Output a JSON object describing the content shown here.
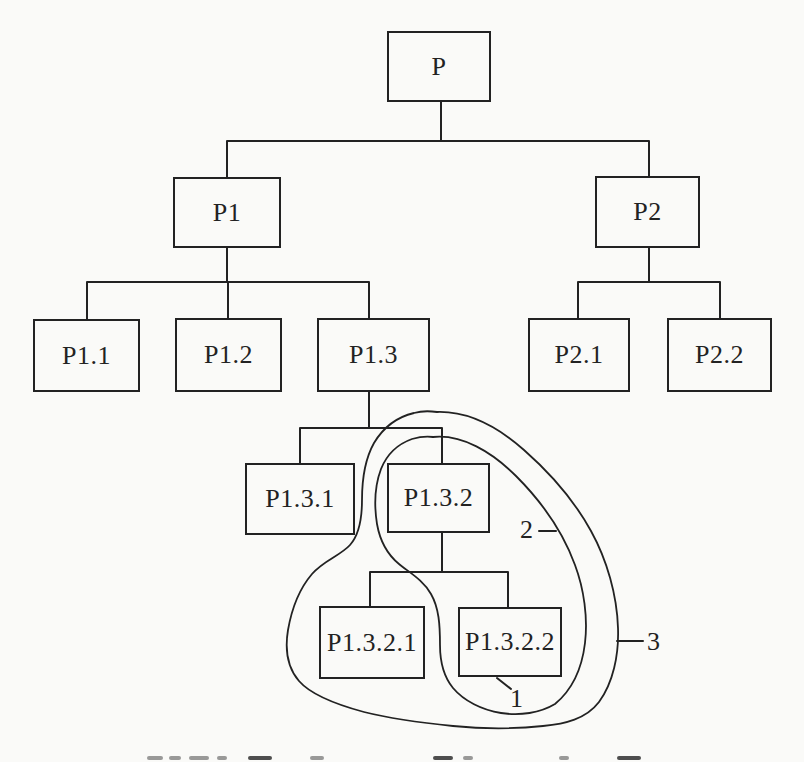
{
  "figure": {
    "type": "tree-diagram",
    "nodes": {
      "p": {
        "label": "P"
      },
      "p1": {
        "label": "P1"
      },
      "p2": {
        "label": "P2"
      },
      "p11": {
        "label": "P1.1"
      },
      "p12": {
        "label": "P1.2"
      },
      "p13": {
        "label": "P1.3"
      },
      "p21": {
        "label": "P2.1"
      },
      "p22": {
        "label": "P2.2"
      },
      "p131": {
        "label": "P1.3.1"
      },
      "p132": {
        "label": "P1.3.2"
      },
      "p1321": {
        "label": "P1.3.2.1"
      },
      "p1322": {
        "label": "P1.3.2.2"
      }
    },
    "edges": [
      [
        "P",
        "P1"
      ],
      [
        "P",
        "P2"
      ],
      [
        "P1",
        "P1.1"
      ],
      [
        "P1",
        "P1.2"
      ],
      [
        "P1",
        "P1.3"
      ],
      [
        "P2",
        "P2.1"
      ],
      [
        "P2",
        "P2.2"
      ],
      [
        "P1.3",
        "P1.3.1"
      ],
      [
        "P1.3",
        "P1.3.2"
      ],
      [
        "P1.3.2",
        "P1.3.2.1"
      ],
      [
        "P1.3.2",
        "P1.3.2.2"
      ]
    ],
    "annotations": {
      "label1": {
        "text": "1",
        "points_to": "P1.3.2.2"
      },
      "label2": {
        "text": "2",
        "points_to_loop_around": [
          "P1.3.2",
          "P1.3.2.2"
        ]
      },
      "label3": {
        "text": "3",
        "points_to_loop_around": [
          "P1.3.2",
          "P1.3.2.1",
          "P1.3.2.2"
        ]
      }
    },
    "colors": {
      "ink": "#222222",
      "paper": "#fafaf8"
    },
    "caption": {
      "clipped": true
    }
  }
}
